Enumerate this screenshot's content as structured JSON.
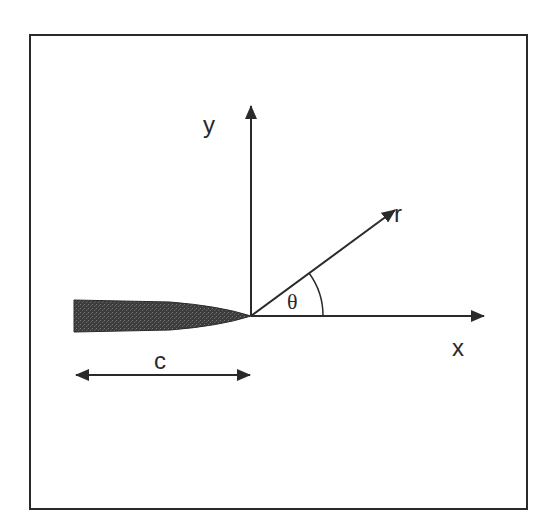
{
  "diagram": {
    "frame": {
      "x": 30,
      "y": 35,
      "width": 497,
      "height": 474
    },
    "colors": {
      "ink": "#2a2a2a",
      "crack_fill": "#3a3a3a",
      "background": "#ffffff"
    },
    "origin": {
      "x": 251,
      "y": 316
    },
    "axes": {
      "x_axis": {
        "label": "x",
        "end": {
          "x": 484,
          "y": 316
        }
      },
      "y_axis": {
        "label": "y",
        "end": {
          "x": 251,
          "y": 105
        }
      },
      "r_vector": {
        "label": "r",
        "end": {
          "x": 395,
          "y": 210
        }
      }
    },
    "angle": {
      "label": "θ",
      "radius": 72,
      "degrees": 36
    },
    "crack": {
      "label": "c",
      "left_x": 74,
      "top_y": 300,
      "bottom_y": 332,
      "tip": {
        "x": 251,
        "y": 316
      }
    },
    "dimension": {
      "label": "c",
      "from_x": 75,
      "to_x": 251,
      "y": 375
    }
  }
}
